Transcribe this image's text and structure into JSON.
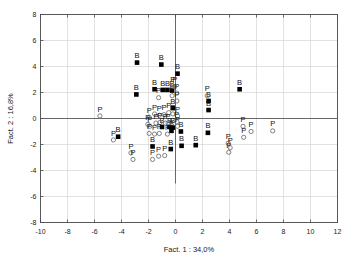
{
  "chart_data": {
    "type": "scatter",
    "title": "",
    "xlabel": "Fact. 1 : 34,0%",
    "ylabel": "Fact. 2 : 16,8%",
    "xlim": [
      -10,
      12
    ],
    "ylim": [
      -8,
      8
    ],
    "xticks": [
      -10,
      -8,
      -6,
      -4,
      -2,
      0,
      2,
      4,
      6,
      8,
      10,
      12
    ],
    "yticks": [
      -8,
      -6,
      -4,
      -2,
      0,
      2,
      4,
      6,
      8
    ],
    "xtick_labels": [
      "-10",
      "-8",
      "-6",
      "-4",
      "-2",
      "0",
      "2",
      "4",
      "6",
      "8",
      "10",
      "12"
    ],
    "ytick_labels": [
      "-8",
      "-6",
      "-4",
      "-2",
      "0",
      "2",
      "4",
      "6",
      "8"
    ],
    "grid": true,
    "legend": "none",
    "origin_lines": {
      "x": 0,
      "y": 0
    },
    "series": [
      {
        "name": "B",
        "marker": "filled-square",
        "color": "#000000",
        "label": "B",
        "points": [
          {
            "x": -2.85,
            "y": 4.3
          },
          {
            "x": -1.05,
            "y": 4.15
          },
          {
            "x": 0.15,
            "y": 3.45
          },
          {
            "x": -2.9,
            "y": 1.85
          },
          {
            "x": -1.55,
            "y": 2.25
          },
          {
            "x": -0.95,
            "y": 2.2
          },
          {
            "x": -0.6,
            "y": 2.2
          },
          {
            "x": -0.25,
            "y": 2.15
          },
          {
            "x": 4.75,
            "y": 2.25
          },
          {
            "x": 2.45,
            "y": 1.35
          },
          {
            "x": 2.45,
            "y": 0.65
          },
          {
            "x": -0.2,
            "y": 0.8
          },
          {
            "x": -1.0,
            "y": -0.65
          },
          {
            "x": -0.45,
            "y": -0.65
          },
          {
            "x": -0.2,
            "y": -0.7
          },
          {
            "x": -0.3,
            "y": -0.95
          },
          {
            "x": 0.4,
            "y": -1.0
          },
          {
            "x": 2.4,
            "y": -1.1
          },
          {
            "x": -4.25,
            "y": -1.4
          },
          {
            "x": -1.7,
            "y": -2.15
          },
          {
            "x": -0.35,
            "y": -2.35
          },
          {
            "x": 0.45,
            "y": -2.1
          },
          {
            "x": 1.5,
            "y": -2.05
          }
        ]
      },
      {
        "name": "P",
        "marker": "open-circle",
        "color": "#6b6b6b",
        "label": "P",
        "points": [
          {
            "x": -5.6,
            "y": 0.2
          },
          {
            "x": -1.95,
            "y": 0.1
          },
          {
            "x": -1.55,
            "y": 0.35
          },
          {
            "x": -1.2,
            "y": 0.25
          },
          {
            "x": -0.85,
            "y": 0.3
          },
          {
            "x": -0.5,
            "y": 0.45
          },
          {
            "x": -0.2,
            "y": 0.35
          },
          {
            "x": 0.15,
            "y": 0.2
          },
          {
            "x": -1.25,
            "y": 1.6
          },
          {
            "x": -0.25,
            "y": 1.75
          },
          {
            "x": -0.2,
            "y": 2.5
          },
          {
            "x": -0.05,
            "y": 2.45
          },
          {
            "x": 0.1,
            "y": 1.95
          },
          {
            "x": 0.1,
            "y": 1.35
          },
          {
            "x": 2.35,
            "y": 1.75
          },
          {
            "x": -2.05,
            "y": -0.45
          },
          {
            "x": -1.9,
            "y": -0.6
          },
          {
            "x": -1.45,
            "y": -0.35
          },
          {
            "x": -1.15,
            "y": -0.3
          },
          {
            "x": -0.75,
            "y": -0.35
          },
          {
            "x": -0.55,
            "y": -0.35
          },
          {
            "x": 0.1,
            "y": -0.25
          },
          {
            "x": 0.15,
            "y": -0.6
          },
          {
            "x": -1.95,
            "y": -1.15
          },
          {
            "x": -1.55,
            "y": -1.2
          },
          {
            "x": -1.2,
            "y": -1.15
          },
          {
            "x": -0.6,
            "y": -1.2
          },
          {
            "x": -4.6,
            "y": -1.65
          },
          {
            "x": -3.3,
            "y": -2.65
          },
          {
            "x": -3.15,
            "y": -3.15
          },
          {
            "x": -1.7,
            "y": -3.15
          },
          {
            "x": -1.25,
            "y": -2.9
          },
          {
            "x": -0.8,
            "y": -2.85
          },
          {
            "x": 5.0,
            "y": -0.6
          },
          {
            "x": 5.6,
            "y": -1.0
          },
          {
            "x": 7.2,
            "y": -0.95
          },
          {
            "x": 5.05,
            "y": -1.45
          },
          {
            "x": 3.9,
            "y": -1.9
          },
          {
            "x": 4.05,
            "y": -2.25
          },
          {
            "x": 3.95,
            "y": -2.6
          }
        ]
      }
    ]
  }
}
